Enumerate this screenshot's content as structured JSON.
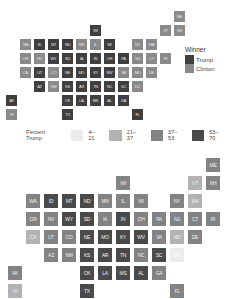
{
  "chart_data": [
    {
      "type": "tile-map",
      "title": "",
      "legend": {
        "title": "Winner",
        "entries": [
          {
            "label": "Trump",
            "color": "#3f3f3f"
          },
          {
            "label": "Clinton",
            "color": "#8a8a8a"
          }
        ]
      },
      "tiles": [
        {
          "state": "ME",
          "col": 12,
          "row": 0,
          "winner": "Clinton"
        },
        {
          "state": "WI",
          "col": 6,
          "row": 1,
          "winner": "Trump"
        },
        {
          "state": "VT",
          "col": 11,
          "row": 1,
          "winner": "Clinton"
        },
        {
          "state": "NH",
          "col": 12,
          "row": 1,
          "winner": "Clinton"
        },
        {
          "state": "WA",
          "col": 1,
          "row": 2,
          "winner": "Clinton"
        },
        {
          "state": "ID",
          "col": 2,
          "row": 2,
          "winner": "Trump"
        },
        {
          "state": "MT",
          "col": 3,
          "row": 2,
          "winner": "Trump"
        },
        {
          "state": "ND",
          "col": 4,
          "row": 2,
          "winner": "Trump"
        },
        {
          "state": "MN",
          "col": 5,
          "row": 2,
          "winner": "Clinton"
        },
        {
          "state": "IL",
          "col": 6,
          "row": 2,
          "winner": "Clinton"
        },
        {
          "state": "MI",
          "col": 7,
          "row": 2,
          "winner": "Trump"
        },
        {
          "state": "NY",
          "col": 9,
          "row": 2,
          "winner": "Clinton"
        },
        {
          "state": "MA",
          "col": 10,
          "row": 2,
          "winner": "Clinton"
        },
        {
          "state": "OR",
          "col": 1,
          "row": 3,
          "winner": "Clinton"
        },
        {
          "state": "NV",
          "col": 2,
          "row": 3,
          "winner": "Clinton"
        },
        {
          "state": "WY",
          "col": 3,
          "row": 3,
          "winner": "Trump"
        },
        {
          "state": "SD",
          "col": 4,
          "row": 3,
          "winner": "Trump"
        },
        {
          "state": "IA",
          "col": 5,
          "row": 3,
          "winner": "Trump"
        },
        {
          "state": "IN",
          "col": 6,
          "row": 3,
          "winner": "Trump"
        },
        {
          "state": "OH",
          "col": 7,
          "row": 3,
          "winner": "Trump"
        },
        {
          "state": "PA",
          "col": 8,
          "row": 3,
          "winner": "Trump"
        },
        {
          "state": "NJ",
          "col": 9,
          "row": 3,
          "winner": "Clinton"
        },
        {
          "state": "CT",
          "col": 10,
          "row": 3,
          "winner": "Clinton"
        },
        {
          "state": "RI",
          "col": 11,
          "row": 3,
          "winner": "Clinton"
        },
        {
          "state": "CA",
          "col": 1,
          "row": 4,
          "winner": "Clinton"
        },
        {
          "state": "UT",
          "col": 2,
          "row": 4,
          "winner": "Trump"
        },
        {
          "state": "CO",
          "col": 3,
          "row": 4,
          "winner": "Clinton"
        },
        {
          "state": "NE",
          "col": 4,
          "row": 4,
          "winner": "Trump"
        },
        {
          "state": "MO",
          "col": 5,
          "row": 4,
          "winner": "Trump"
        },
        {
          "state": "KY",
          "col": 6,
          "row": 4,
          "winner": "Trump"
        },
        {
          "state": "WV",
          "col": 7,
          "row": 4,
          "winner": "Trump"
        },
        {
          "state": "VA",
          "col": 8,
          "row": 4,
          "winner": "Clinton"
        },
        {
          "state": "MD",
          "col": 9,
          "row": 4,
          "winner": "Clinton"
        },
        {
          "state": "DE",
          "col": 10,
          "row": 4,
          "winner": "Clinton"
        },
        {
          "state": "AZ",
          "col": 2,
          "row": 5,
          "winner": "Trump"
        },
        {
          "state": "NM",
          "col": 3,
          "row": 5,
          "winner": "Clinton"
        },
        {
          "state": "KS",
          "col": 4,
          "row": 5,
          "winner": "Trump"
        },
        {
          "state": "AR",
          "col": 5,
          "row": 5,
          "winner": "Trump"
        },
        {
          "state": "TN",
          "col": 6,
          "row": 5,
          "winner": "Trump"
        },
        {
          "state": "NC",
          "col": 7,
          "row": 5,
          "winner": "Trump"
        },
        {
          "state": "SC",
          "col": 8,
          "row": 5,
          "winner": "Trump"
        },
        {
          "state": "DC",
          "col": 9,
          "row": 5,
          "winner": "Clinton"
        },
        {
          "state": "AK",
          "col": 0,
          "row": 6,
          "winner": "Trump"
        },
        {
          "state": "OK",
          "col": 4,
          "row": 6,
          "winner": "Trump"
        },
        {
          "state": "LA",
          "col": 5,
          "row": 6,
          "winner": "Trump"
        },
        {
          "state": "MS",
          "col": 6,
          "row": 6,
          "winner": "Trump"
        },
        {
          "state": "AL",
          "col": 7,
          "row": 6,
          "winner": "Trump"
        },
        {
          "state": "GA",
          "col": 8,
          "row": 6,
          "winner": "Trump"
        },
        {
          "state": "HI",
          "col": 0,
          "row": 7,
          "winner": "Clinton"
        },
        {
          "state": "TX",
          "col": 4,
          "row": 7,
          "winner": "Trump"
        },
        {
          "state": "FL",
          "col": 9,
          "row": 7,
          "winner": "Trump"
        }
      ]
    },
    {
      "type": "tile-map",
      "title": "",
      "legend": {
        "title": "Percent Trump",
        "entries": [
          {
            "label": "4–21",
            "range": [
              4,
              21
            ],
            "color": "#ececec"
          },
          {
            "label": "21–37",
            "range": [
              21,
              37
            ],
            "color": "#b3b3b3"
          },
          {
            "label": "37–53",
            "range": [
              37,
              53
            ],
            "color": "#838383"
          },
          {
            "label": "53–70",
            "range": [
              53,
              70
            ],
            "color": "#4a4a4a"
          }
        ]
      },
      "tiles": [
        {
          "state": "ME",
          "col": 11,
          "row": 0,
          "bin": "37–53"
        },
        {
          "state": "WI",
          "col": 6,
          "row": 1,
          "bin": "37–53"
        },
        {
          "state": "VT",
          "col": 10,
          "row": 1,
          "bin": "21–37"
        },
        {
          "state": "NH",
          "col": 11,
          "row": 1,
          "bin": "37–53"
        },
        {
          "state": "WA",
          "col": 1,
          "row": 2,
          "bin": "37–53"
        },
        {
          "state": "ID",
          "col": 2,
          "row": 2,
          "bin": "53–70"
        },
        {
          "state": "MT",
          "col": 3,
          "row": 2,
          "bin": "53–70"
        },
        {
          "state": "ND",
          "col": 4,
          "row": 2,
          "bin": "53–70"
        },
        {
          "state": "MN",
          "col": 5,
          "row": 2,
          "bin": "37–53"
        },
        {
          "state": "IL",
          "col": 6,
          "row": 2,
          "bin": "37–53"
        },
        {
          "state": "MI",
          "col": 7,
          "row": 2,
          "bin": "37–53"
        },
        {
          "state": "NY",
          "col": 9,
          "row": 2,
          "bin": "37–53"
        },
        {
          "state": "MA",
          "col": 10,
          "row": 2,
          "bin": "21–37"
        },
        {
          "state": "OR",
          "col": 1,
          "row": 3,
          "bin": "37–53"
        },
        {
          "state": "NV",
          "col": 2,
          "row": 3,
          "bin": "37–53"
        },
        {
          "state": "WY",
          "col": 3,
          "row": 3,
          "bin": "53–70"
        },
        {
          "state": "SD",
          "col": 4,
          "row": 3,
          "bin": "53–70"
        },
        {
          "state": "IA",
          "col": 5,
          "row": 3,
          "bin": "37–53"
        },
        {
          "state": "IN",
          "col": 6,
          "row": 3,
          "bin": "53–70"
        },
        {
          "state": "OH",
          "col": 7,
          "row": 3,
          "bin": "37–53"
        },
        {
          "state": "PA",
          "col": 8,
          "row": 3,
          "bin": "37–53"
        },
        {
          "state": "NJ",
          "col": 9,
          "row": 3,
          "bin": "37–53"
        },
        {
          "state": "CT",
          "col": 10,
          "row": 3,
          "bin": "37–53"
        },
        {
          "state": "RI",
          "col": 11,
          "row": 3,
          "bin": "37–53"
        },
        {
          "state": "CA",
          "col": 1,
          "row": 4,
          "bin": "21–37"
        },
        {
          "state": "UT",
          "col": 2,
          "row": 4,
          "bin": "37–53"
        },
        {
          "state": "CO",
          "col": 3,
          "row": 4,
          "bin": "37–53"
        },
        {
          "state": "NE",
          "col": 4,
          "row": 4,
          "bin": "53–70"
        },
        {
          "state": "MO",
          "col": 5,
          "row": 4,
          "bin": "53–70"
        },
        {
          "state": "KY",
          "col": 6,
          "row": 4,
          "bin": "53–70"
        },
        {
          "state": "WV",
          "col": 7,
          "row": 4,
          "bin": "53–70"
        },
        {
          "state": "VA",
          "col": 8,
          "row": 4,
          "bin": "37–53"
        },
        {
          "state": "MD",
          "col": 9,
          "row": 4,
          "bin": "21–37"
        },
        {
          "state": "DE",
          "col": 10,
          "row": 4,
          "bin": "37–53"
        },
        {
          "state": "AZ",
          "col": 2,
          "row": 5,
          "bin": "37–53"
        },
        {
          "state": "NM",
          "col": 3,
          "row": 5,
          "bin": "37–53"
        },
        {
          "state": "KS",
          "col": 4,
          "row": 5,
          "bin": "53–70"
        },
        {
          "state": "AR",
          "col": 5,
          "row": 5,
          "bin": "53–70"
        },
        {
          "state": "TN",
          "col": 6,
          "row": 5,
          "bin": "53–70"
        },
        {
          "state": "NC",
          "col": 7,
          "row": 5,
          "bin": "37–53"
        },
        {
          "state": "SC",
          "col": 8,
          "row": 5,
          "bin": "53–70"
        },
        {
          "state": "DC",
          "col": 9,
          "row": 5,
          "bin": "4–21"
        },
        {
          "state": "AK",
          "col": 0,
          "row": 6,
          "bin": "37–53"
        },
        {
          "state": "OK",
          "col": 4,
          "row": 6,
          "bin": "53–70"
        },
        {
          "state": "LA",
          "col": 5,
          "row": 6,
          "bin": "53–70"
        },
        {
          "state": "MS",
          "col": 6,
          "row": 6,
          "bin": "53–70"
        },
        {
          "state": "AL",
          "col": 7,
          "row": 6,
          "bin": "53–70"
        },
        {
          "state": "GA",
          "col": 8,
          "row": 6,
          "bin": "37–53"
        },
        {
          "state": "HI",
          "col": 0,
          "row": 7,
          "bin": "21–37"
        },
        {
          "state": "TX",
          "col": 4,
          "row": 7,
          "bin": "53–70"
        },
        {
          "state": "FL",
          "col": 9,
          "row": 7,
          "bin": "37–53"
        }
      ]
    }
  ],
  "map1": {
    "legend_title": "Winner",
    "legend_items": [
      "Trump",
      "Clinton"
    ]
  },
  "map2": {
    "legend_title": "Percent Trump",
    "legend_items": [
      "4–21",
      "21–37",
      "37–53",
      "53–70"
    ]
  }
}
